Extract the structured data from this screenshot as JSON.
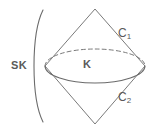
{
  "figure": {
    "kind": "geometry-diagram",
    "background_color": "#ffffff",
    "stroke_color": "#6b6b6b",
    "label_color": "#5a5a5a"
  },
  "labels": {
    "sk": "SK",
    "k": "K",
    "c1_base": "C",
    "c1_sub": "1",
    "c2_base": "C",
    "c2_sub": "2"
  },
  "elements": {
    "bracket_name": "large-left-parenthesis",
    "upper_cone_name": "upper-cone",
    "lower_cone_name": "lower-cone",
    "ellipse_front_name": "ellipse-front-arc-solid",
    "ellipse_back_name": "ellipse-back-arc-dashed"
  }
}
